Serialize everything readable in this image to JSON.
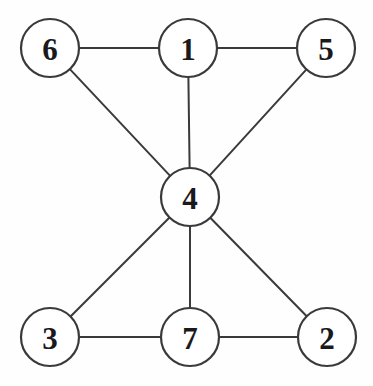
{
  "diagram": {
    "type": "node-link-graph",
    "canvas": {
      "width": 373,
      "height": 386
    },
    "style": {
      "background_color": "#fefefe",
      "node_fill": "#ffffff",
      "node_stroke": "#3a3a3c",
      "edge_color": "#3a3a3c",
      "label_color": "#1a1a1c",
      "node_radius": 29,
      "edge_width": 2,
      "node_stroke_width": 2.2,
      "label_font_size": 31
    },
    "nodes": [
      {
        "id": "6",
        "label": "6",
        "cx": 50,
        "cy": 48,
        "r": 29
      },
      {
        "id": "1",
        "label": "1",
        "cx": 188,
        "cy": 48,
        "r": 29
      },
      {
        "id": "5",
        "label": "5",
        "cx": 326,
        "cy": 48,
        "r": 29
      },
      {
        "id": "4",
        "label": "4",
        "cx": 190,
        "cy": 197,
        "r": 29
      },
      {
        "id": "3",
        "label": "3",
        "cx": 50,
        "cy": 337,
        "r": 29
      },
      {
        "id": "7",
        "label": "7",
        "cx": 190,
        "cy": 337,
        "r": 29
      },
      {
        "id": "2",
        "label": "2",
        "cx": 327,
        "cy": 337,
        "r": 29
      }
    ],
    "edges": [
      {
        "source": "6",
        "target": "1"
      },
      {
        "source": "1",
        "target": "5"
      },
      {
        "source": "6",
        "target": "4"
      },
      {
        "source": "1",
        "target": "4"
      },
      {
        "source": "5",
        "target": "4"
      },
      {
        "source": "4",
        "target": "3"
      },
      {
        "source": "4",
        "target": "7"
      },
      {
        "source": "4",
        "target": "2"
      },
      {
        "source": "3",
        "target": "7"
      },
      {
        "source": "7",
        "target": "2"
      }
    ]
  }
}
